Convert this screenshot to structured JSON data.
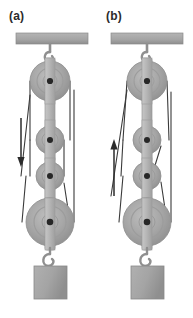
{
  "figure": {
    "type": "physics-diagram",
    "background_color": "#ffffff",
    "panels": [
      {
        "id": "a",
        "label": "(a)",
        "arrow": {
          "name": "rope-pull-direction-arrow",
          "direction": "down",
          "x": 21,
          "y_start": 118,
          "y_end": 166
        }
      },
      {
        "id": "b",
        "label": "(b)",
        "arrow": {
          "name": "rope-pull-direction-arrow",
          "direction": "up",
          "x": 17,
          "y_start": 196,
          "y_end": 140
        }
      }
    ],
    "colors": {
      "ceiling_bar": "#a8a8a8",
      "ceiling_bar_edge": "#8f8f8f",
      "pulley_face": "#a3a3a3",
      "pulley_rim": "#949494",
      "pulley_inner": "#9a9a9a",
      "pulley_hub": "#2a2a2a",
      "bracket": "#b9b9b9",
      "bracket_edge": "#9c9c9c",
      "hook": "#9e9e9e",
      "block": "#a6a6a6",
      "block_edge": "#8d8d8d",
      "rope": "#3a3a3a",
      "arrow": "#2b2b2b",
      "label_text": "#2b2b2b"
    },
    "geometry": {
      "ceiling_bar": {
        "x": 16,
        "y": 33,
        "width": 72,
        "height": 11
      },
      "top_hook": {
        "x": 50,
        "y_top": 44,
        "y_bottom": 62
      },
      "pulleys": [
        {
          "index": 1,
          "cx": 50,
          "cy": 81,
          "r": 20,
          "size": "large"
        },
        {
          "index": 2,
          "cx": 50,
          "cy": 140,
          "r": 14,
          "size": "small"
        },
        {
          "index": 3,
          "cx": 50,
          "cy": 176,
          "r": 14,
          "size": "small"
        },
        {
          "index": 4,
          "cx": 50,
          "cy": 222,
          "r": 24,
          "size": "large"
        }
      ],
      "bottom_hook": {
        "x": 50,
        "y_top": 246,
        "y_bottom": 266
      },
      "block": {
        "x": 34,
        "y": 266,
        "width": 33,
        "height": 33
      }
    }
  }
}
